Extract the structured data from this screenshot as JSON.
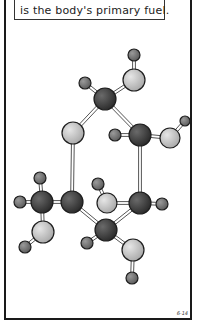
{
  "caption": {
    "text": "is the body's primary fuel."
  },
  "figure_label": "6-14",
  "molecule": {
    "name": "glucose ball-and-stick model",
    "colors": {
      "carbon": "#3c3c3c",
      "oxygen": "#c9c9c9",
      "hydrogen": "#7a7a7a",
      "bond": "#555555",
      "outline": "#1e1e1e"
    },
    "atoms": [
      {
        "id": "H1",
        "el": "hydrogen",
        "x": 134,
        "y": 55,
        "r": 6
      },
      {
        "id": "O1",
        "el": "oxygen",
        "x": 134,
        "y": 80,
        "r": 11
      },
      {
        "id": "H2",
        "el": "hydrogen",
        "x": 85,
        "y": 83,
        "r": 6
      },
      {
        "id": "C1",
        "el": "carbon",
        "x": 105,
        "y": 99,
        "r": 11
      },
      {
        "id": "O2",
        "el": "oxygen",
        "x": 73,
        "y": 133,
        "r": 11
      },
      {
        "id": "H3",
        "el": "hydrogen",
        "x": 115,
        "y": 135,
        "r": 6
      },
      {
        "id": "C2",
        "el": "carbon",
        "x": 140,
        "y": 135,
        "r": 11
      },
      {
        "id": "O3",
        "el": "oxygen",
        "x": 170,
        "y": 138,
        "r": 10
      },
      {
        "id": "H4",
        "el": "hydrogen",
        "x": 185,
        "y": 121,
        "r": 5
      },
      {
        "id": "H5",
        "el": "hydrogen",
        "x": 40,
        "y": 178,
        "r": 6
      },
      {
        "id": "H6",
        "el": "hydrogen",
        "x": 20,
        "y": 202,
        "r": 6
      },
      {
        "id": "C3",
        "el": "carbon",
        "x": 42,
        "y": 202,
        "r": 11
      },
      {
        "id": "C4",
        "el": "carbon",
        "x": 72,
        "y": 202,
        "r": 11
      },
      {
        "id": "H7",
        "el": "hydrogen",
        "x": 98,
        "y": 184,
        "r": 6
      },
      {
        "id": "O4",
        "el": "oxygen",
        "x": 107,
        "y": 203,
        "r": 10
      },
      {
        "id": "C5",
        "el": "carbon",
        "x": 140,
        "y": 203,
        "r": 11
      },
      {
        "id": "H8",
        "el": "hydrogen",
        "x": 162,
        "y": 204,
        "r": 6
      },
      {
        "id": "O5",
        "el": "oxygen",
        "x": 43,
        "y": 232,
        "r": 11
      },
      {
        "id": "C6",
        "el": "carbon",
        "x": 106,
        "y": 230,
        "r": 11
      },
      {
        "id": "H9",
        "el": "hydrogen",
        "x": 25,
        "y": 247,
        "r": 6
      },
      {
        "id": "H10",
        "el": "hydrogen",
        "x": 87,
        "y": 243,
        "r": 6
      },
      {
        "id": "O6",
        "el": "oxygen",
        "x": 133,
        "y": 250,
        "r": 11
      },
      {
        "id": "H11",
        "el": "hydrogen",
        "x": 132,
        "y": 278,
        "r": 6
      }
    ],
    "bonds": [
      [
        "H1",
        "O1"
      ],
      [
        "O1",
        "C1"
      ],
      [
        "H2",
        "C1"
      ],
      [
        "C1",
        "O2"
      ],
      [
        "C1",
        "C2"
      ],
      [
        "H3",
        "C2"
      ],
      [
        "C2",
        "O3"
      ],
      [
        "O3",
        "H4"
      ],
      [
        "O2",
        "C4"
      ],
      [
        "C2",
        "C5"
      ],
      [
        "H5",
        "C3"
      ],
      [
        "H6",
        "C3"
      ],
      [
        "C3",
        "C4"
      ],
      [
        "C3",
        "O5"
      ],
      [
        "O5",
        "H9"
      ],
      [
        "C4",
        "C6"
      ],
      [
        "H7",
        "O4"
      ],
      [
        "O4",
        "C5"
      ],
      [
        "C5",
        "H8"
      ],
      [
        "C5",
        "C6"
      ],
      [
        "C6",
        "H10"
      ],
      [
        "C6",
        "O6"
      ],
      [
        "O6",
        "H11"
      ]
    ]
  }
}
